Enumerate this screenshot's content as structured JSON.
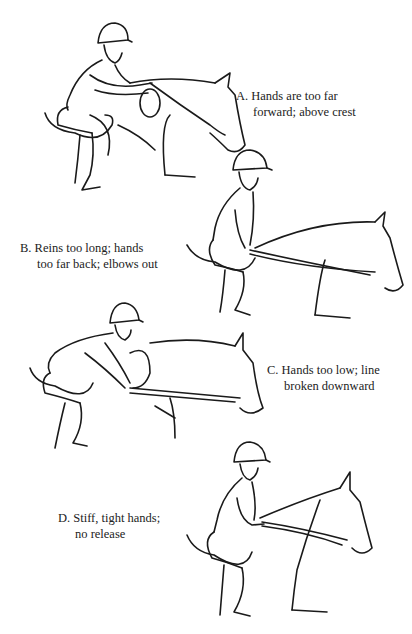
{
  "figures": [
    {
      "id": "A",
      "caption_line1": "A. Hands are too far",
      "caption_line2": "forward; above crest",
      "description": "rider leaning forward, hands pushed up the horse's neck"
    },
    {
      "id": "B",
      "caption_line1": "B. Reins too long; hands",
      "caption_line2": "too far back; elbows out",
      "description": "rider upright, long loose reins, hands at hips"
    },
    {
      "id": "C",
      "caption_line1": "C. Hands too low; line",
      "caption_line2": "broken downward",
      "description": "rider folded low with hands below the neck line"
    },
    {
      "id": "D",
      "caption_line1": "D. Stiff, tight hands;",
      "caption_line2": "no release",
      "description": "rider upright with short, fixed reins"
    }
  ]
}
